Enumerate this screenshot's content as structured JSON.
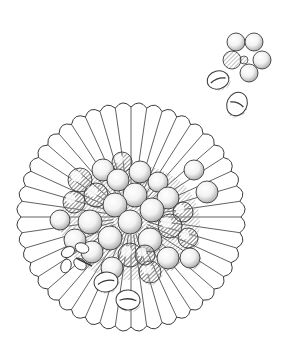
{
  "image": {
    "description": "Black-and-white line illustration of a fluted paper cup seen from above, holding a pile of round beans/berries with a small leaf sprig and two split coffee-like beans; a five-bean flower-shaped cluster and two split beans float at upper right.",
    "background_color": "#ffffff",
    "ink_color": "#3a3a3a",
    "shade_color": "#9a9a9a"
  },
  "dish": {
    "cx": 131,
    "cy": 217,
    "r": 110,
    "flutes": 44
  },
  "cluster_beans": [
    [
      122,
      162,
      10
    ],
    [
      103,
      170,
      11
    ],
    [
      140,
      172,
      11
    ],
    [
      80,
      180,
      12
    ],
    [
      118,
      180,
      11
    ],
    [
      158,
      182,
      10
    ],
    [
      96,
      195,
      12
    ],
    [
      135,
      195,
      12
    ],
    [
      168,
      198,
      11
    ],
    [
      74,
      202,
      11
    ],
    [
      115,
      205,
      12
    ],
    [
      152,
      210,
      12
    ],
    [
      183,
      212,
      10
    ],
    [
      90,
      222,
      12
    ],
    [
      130,
      222,
      12
    ],
    [
      170,
      226,
      12
    ],
    [
      110,
      238,
      12
    ],
    [
      150,
      240,
      12
    ],
    [
      188,
      238,
      10
    ],
    [
      75,
      240,
      11
    ],
    [
      92,
      252,
      11
    ],
    [
      130,
      255,
      12
    ],
    [
      168,
      258,
      11
    ],
    [
      112,
      268,
      11
    ],
    [
      150,
      272,
      11
    ],
    [
      190,
      258,
      10
    ],
    [
      60,
      220,
      10
    ],
    [
      145,
      255,
      10
    ]
  ],
  "loose_beans": [
    {
      "cx": 194,
      "cy": 170,
      "r": 10
    },
    {
      "cx": 207,
      "cy": 192,
      "r": 11
    }
  ],
  "flower_cluster": {
    "cx": 244,
    "cy": 60,
    "beans": [
      [
        236,
        42,
        9
      ],
      [
        254,
        42,
        9
      ],
      [
        262,
        60,
        9
      ],
      [
        249,
        73,
        9
      ],
      [
        232,
        60,
        9
      ]
    ]
  },
  "split_beans": [
    {
      "cx": 218,
      "cy": 80,
      "rx": 11,
      "ry": 9,
      "rot": -15
    },
    {
      "cx": 237,
      "cy": 104,
      "rx": 10,
      "ry": 12,
      "rot": 25
    },
    {
      "cx": 106,
      "cy": 282,
      "rx": 12,
      "ry": 10,
      "rot": -10
    },
    {
      "cx": 128,
      "cy": 300,
      "rx": 12,
      "ry": 10,
      "rot": 5
    }
  ],
  "leaf_sprig": {
    "cx": 76,
    "cy": 258
  }
}
